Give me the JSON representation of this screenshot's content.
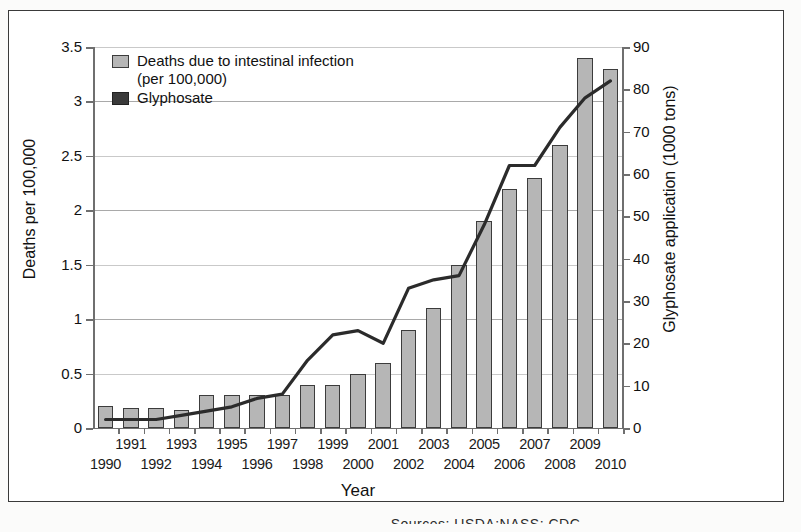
{
  "figure": {
    "xtitle": "Year",
    "ytitle_left": "Deaths per 100,000",
    "ytitle_right": "Glyphosate application (1000 tons)",
    "source_note": "Sources: USDA:NASS; CDC"
  },
  "legend": {
    "items": [
      {
        "label": "Deaths due to intestinal infection (per 100,000)",
        "swatch": "bars",
        "color": "#b6b6b6"
      },
      {
        "label": "Glyphosate",
        "swatch": "line",
        "color": "#3a3a3a"
      }
    ]
  },
  "chart_data": {
    "type": "bar",
    "title": "",
    "xlabel": "Year",
    "ylabel": "Deaths per 100,000",
    "y2label": "Glyphosate application (1000 tons)",
    "ylim": [
      0,
      3.5
    ],
    "y2lim": [
      0,
      90
    ],
    "yticks": [
      "0",
      "0.5",
      "1",
      "1.5",
      "2",
      "2.5",
      "3",
      "3.5"
    ],
    "y2ticks": [
      "0",
      "10",
      "20",
      "30",
      "40",
      "50",
      "60",
      "70",
      "80",
      "90"
    ],
    "grid": true,
    "legend_position": "top-left",
    "categories": [
      "1990",
      "1991",
      "1992",
      "1993",
      "1994",
      "1995",
      "1996",
      "1997",
      "1998",
      "1999",
      "2000",
      "2001",
      "2002",
      "2003",
      "2004",
      "2005",
      "2006",
      "2007",
      "2008",
      "2009",
      "2010"
    ],
    "series": [
      {
        "name": "Deaths due to intestinal infection (per 100,000)",
        "type": "bar",
        "axis": "left",
        "units": "deaths per 100,000",
        "values": [
          0.2,
          0.18,
          0.18,
          0.17,
          0.3,
          0.3,
          0.3,
          0.3,
          0.4,
          0.4,
          0.5,
          0.6,
          0.9,
          1.1,
          1.5,
          1.9,
          2.2,
          2.3,
          2.6,
          3.4,
          3.3
        ]
      },
      {
        "name": "Glyphosate",
        "type": "line",
        "axis": "right",
        "units": "1000 tons",
        "values": [
          2,
          2,
          2,
          3,
          4,
          5,
          7,
          8,
          16,
          22,
          23,
          20,
          33,
          35,
          36,
          48,
          62,
          62,
          71,
          78,
          82
        ]
      }
    ]
  },
  "xaxis_labels": {
    "row_top": [
      "1991",
      "1993",
      "1995",
      "1997",
      "1999",
      "2001",
      "2003",
      "2005",
      "2007",
      "2009"
    ],
    "row_bottom": [
      "1990",
      "1992",
      "1994",
      "1996",
      "1998",
      "2000",
      "2002",
      "2004",
      "2006",
      "2008",
      "2010"
    ]
  },
  "colors": {
    "bar_fill": "#b6b6b6",
    "bar_stroke": "#3c3c3c",
    "line": "#2b2b2b",
    "grid": "#a9a9a9",
    "axis": "#6f6f6f",
    "frame": "#3a3a3a"
  }
}
